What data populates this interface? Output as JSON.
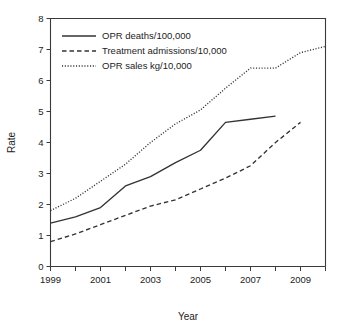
{
  "chart_data": {
    "type": "line",
    "title": "",
    "xlabel": "Year",
    "ylabel": "Rate",
    "xlim": [
      1999,
      2010
    ],
    "ylim": [
      0,
      8
    ],
    "grid": false,
    "legend_position": "top-left",
    "x_ticks": [
      1999,
      2000,
      2001,
      2002,
      2003,
      2004,
      2005,
      2006,
      2007,
      2008,
      2009,
      2010
    ],
    "x_tick_labels": [
      "1999",
      "",
      "2001",
      "",
      "2003",
      "",
      "2005",
      "",
      "2007",
      "",
      "2009",
      ""
    ],
    "y_ticks": [
      0,
      1,
      2,
      3,
      4,
      5,
      6,
      7,
      8
    ],
    "y_tick_labels": [
      "0",
      "1",
      "2",
      "3",
      "4",
      "5",
      "6",
      "7",
      "8"
    ],
    "series": [
      {
        "name": "OPR deaths/100,000",
        "style": "solid",
        "color": "#333333",
        "x": [
          1999,
          2000,
          2001,
          2002,
          2003,
          2004,
          2005,
          2006,
          2007,
          2008
        ],
        "values": [
          1.4,
          1.6,
          1.9,
          2.6,
          2.9,
          3.35,
          3.75,
          4.65,
          4.75,
          4.85
        ]
      },
      {
        "name": "Treatment admissions/10,000",
        "style": "dashed",
        "color": "#333333",
        "x": [
          1999,
          2000,
          2001,
          2002,
          2003,
          2004,
          2005,
          2006,
          2007,
          2008,
          2009
        ],
        "values": [
          0.8,
          1.05,
          1.35,
          1.65,
          1.95,
          2.15,
          2.5,
          2.85,
          3.25,
          4.0,
          4.65
        ]
      },
      {
        "name": "OPR sales kg/10,000",
        "style": "dotted",
        "color": "#333333",
        "x": [
          1999,
          2000,
          2001,
          2002,
          2003,
          2004,
          2005,
          2006,
          2007,
          2008,
          2009,
          2010
        ],
        "values": [
          1.8,
          2.2,
          2.75,
          3.3,
          4.0,
          4.6,
          5.05,
          5.75,
          6.4,
          6.4,
          6.9,
          7.1
        ]
      }
    ]
  },
  "legend": {
    "items": [
      {
        "label": "OPR deaths/100,000",
        "style": "solid"
      },
      {
        "label": "Treatment admissions/10,000",
        "style": "dashed"
      },
      {
        "label": "OPR sales kg/10,000",
        "style": "dotted"
      }
    ]
  },
  "axes": {
    "x_title": "Year",
    "y_title": "Rate"
  }
}
